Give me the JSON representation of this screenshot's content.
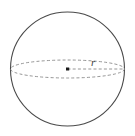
{
  "figure": {
    "background_color": "#ffffff",
    "outline_color": "#4a4a4a",
    "dash_color": "#8a8a8a",
    "dot_color": "#1a1a1a",
    "label_color": "#3b3b3b",
    "sphere": {
      "center_x": 67.5,
      "center_y": 69,
      "radius": 57
    },
    "equator": {
      "semi_major_axis": 57,
      "semi_minor_axis": 9,
      "style": "dashed"
    },
    "radius_line": {
      "from_x": 67.5,
      "from_y": 69,
      "to_x": 124.5,
      "to_y": 69,
      "style": "dashed"
    },
    "center_dot": {
      "x": 67.5,
      "y": 69,
      "size": 3
    },
    "labels": {
      "radius": "r",
      "radius_x": 91,
      "radius_y": 66
    }
  }
}
